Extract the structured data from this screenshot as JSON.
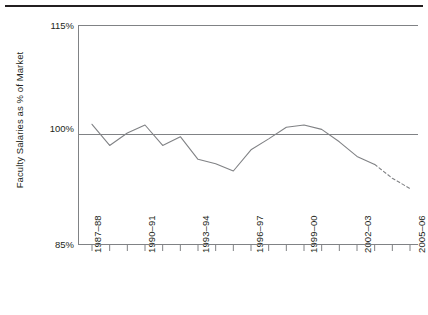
{
  "figure": {
    "ylabel": "Faculty Salaries as % of Market",
    "colors": {
      "rule": "#231f20",
      "axis": "#808285",
      "line": "#808285",
      "text": "#231f20"
    }
  },
  "chart_data": {
    "type": "line",
    "title": "",
    "xlabel": "",
    "ylabel": "Faculty Salaries as % of Market",
    "ylim": [
      85,
      115
    ],
    "yticks": [
      85,
      100,
      115
    ],
    "ytick_labels": [
      "85%",
      "100%",
      "115%"
    ],
    "grid": false,
    "reference_line": 100,
    "legend": "none",
    "categories": [
      "1987–88",
      "1988–89",
      "1989–90",
      "1990–91",
      "1991–92",
      "1992–93",
      "1993–94",
      "1994–95",
      "1995–96",
      "1996–97",
      "1997–98",
      "1998–99",
      "1999–00",
      "2000–01",
      "2001–02",
      "2002–03",
      "2003–04",
      "2004–05",
      "2005–06"
    ],
    "xtick_labels_shown": [
      "1987–88",
      "1990–91",
      "1993–94",
      "1996–97",
      "1999–00",
      "2002–03",
      "2005–06"
    ],
    "series": [
      {
        "name": "Faculty Salaries as % of Market",
        "values": [
          101.4,
          98.5,
          100.2,
          101.3,
          98.5,
          99.7,
          96.6,
          96.0,
          95.0,
          97.9,
          99.4,
          101.0,
          101.3,
          100.7,
          99.0,
          97.0,
          95.9,
          94.0,
          92.6
        ],
        "projected_from_index": 16,
        "projected_style": "dashed"
      }
    ]
  }
}
